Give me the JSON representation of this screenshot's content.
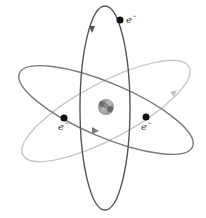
{
  "diagram": {
    "type": "atom-model",
    "nucleus": {
      "label": ""
    },
    "orbits": [
      {
        "name": "vertical-orbit",
        "color": "#555555"
      },
      {
        "name": "tilted-orbit-dark",
        "color": "#7a7a7a"
      },
      {
        "name": "tilted-orbit-light",
        "color": "#c4c4c4"
      }
    ],
    "electrons": [
      {
        "label": "e",
        "charge": "−"
      },
      {
        "label": "e",
        "charge": "−"
      },
      {
        "label": "e",
        "charge": "−"
      }
    ]
  }
}
